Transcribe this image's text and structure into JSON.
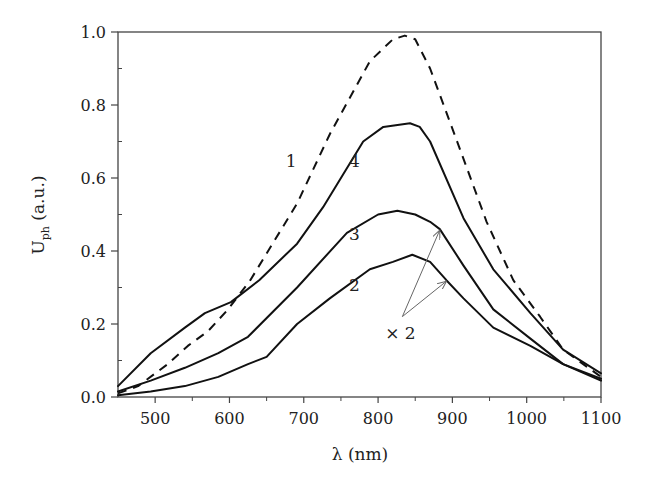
{
  "chart_data": {
    "type": "line",
    "title": "",
    "xlabel": "λ (nm)",
    "ylabel": "U_ph (a.u.)",
    "ylabel_main": "U",
    "ylabel_sub": "ph",
    "ylabel_unit": "(a.u.)",
    "xlim": [
      450,
      1100
    ],
    "ylim": [
      0.0,
      1.0
    ],
    "xticks": [
      500,
      600,
      700,
      800,
      900,
      1000,
      1100
    ],
    "xtick_labels": [
      "500",
      "600",
      "700",
      "800",
      "900",
      "1000",
      "1100"
    ],
    "yticks": [
      0.0,
      0.2,
      0.4,
      0.6,
      0.8,
      1.0
    ],
    "ytick_labels": [
      "0.0",
      "0.2",
      "0.4",
      "0.6",
      "0.8",
      "1.0"
    ],
    "grid": false,
    "legend": "none (curves labeled inline)",
    "series": [
      {
        "name": "1",
        "style": "dashed",
        "x": [
          450,
          477,
          517,
          544,
          571,
          598,
          628,
          691,
          735,
          789,
          820,
          836,
          850,
          870,
          901,
          946,
          982,
          1018,
          1049,
          1100
        ],
        "y": [
          0.01,
          0.03,
          0.09,
          0.14,
          0.18,
          0.24,
          0.32,
          0.53,
          0.72,
          0.92,
          0.98,
          0.99,
          0.98,
          0.9,
          0.73,
          0.48,
          0.32,
          0.22,
          0.13,
          0.055
        ]
      },
      {
        "name": "2",
        "style": "solid",
        "note": "× 2",
        "x": [
          450,
          494,
          540,
          585,
          625,
          650,
          691,
          735,
          789,
          820,
          846,
          870,
          892,
          915,
          955,
          1005,
          1049,
          1100
        ],
        "y": [
          0.005,
          0.015,
          0.03,
          0.055,
          0.09,
          0.11,
          0.2,
          0.27,
          0.35,
          0.37,
          0.39,
          0.37,
          0.32,
          0.27,
          0.19,
          0.14,
          0.09,
          0.045
        ]
      },
      {
        "name": "3",
        "style": "solid",
        "note": "× 2",
        "x": [
          450,
          494,
          540,
          585,
          625,
          691,
          758,
          800,
          826,
          850,
          870,
          883,
          915,
          955,
          1005,
          1049,
          1100
        ],
        "y": [
          0.015,
          0.045,
          0.08,
          0.12,
          0.165,
          0.3,
          0.45,
          0.5,
          0.51,
          0.5,
          0.48,
          0.46,
          0.36,
          0.24,
          0.16,
          0.09,
          0.05
        ]
      },
      {
        "name": "4",
        "style": "solid",
        "x": [
          450,
          494,
          540,
          567,
          602,
          640,
          691,
          726,
          780,
          807,
          843,
          856,
          870,
          915,
          955,
          1005,
          1049,
          1100
        ],
        "y": [
          0.03,
          0.12,
          0.19,
          0.23,
          0.26,
          0.32,
          0.42,
          0.52,
          0.7,
          0.74,
          0.75,
          0.74,
          0.7,
          0.49,
          0.35,
          0.23,
          0.13,
          0.065
        ]
      }
    ],
    "annotations": [
      {
        "text": "1",
        "x": 683,
        "y": 0.63
      },
      {
        "text": "4",
        "x": 768,
        "y": 0.63
      },
      {
        "text": "3",
        "x": 768,
        "y": 0.43
      },
      {
        "text": "2",
        "x": 768,
        "y": 0.29
      },
      {
        "text": "× 2",
        "x": 830,
        "y": 0.16,
        "arrows_to": [
          {
            "x": 883,
            "y": 0.46
          },
          {
            "x": 892,
            "y": 0.32
          }
        ]
      }
    ]
  }
}
